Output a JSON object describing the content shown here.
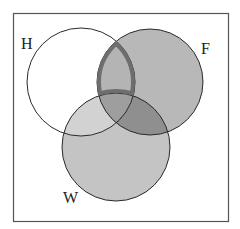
{
  "diagram": {
    "type": "venn-3",
    "sets": [
      {
        "id": "H",
        "label": "H",
        "cx": 81,
        "cy": 82,
        "r": 54,
        "fill": "#ffffff"
      },
      {
        "id": "F",
        "label": "F",
        "cx": 150,
        "cy": 82,
        "r": 53,
        "fill": "#b8b8b8"
      },
      {
        "id": "W",
        "label": "W",
        "cx": 116,
        "cy": 147,
        "r": 54,
        "fill": "#c4c4c4"
      }
    ],
    "regions": {
      "H_and_W_only": "#d2d2d2",
      "F_and_W_only": "#8f8f8f",
      "H_and_F_and_W": "#9e9e9e",
      "H_and_F_not_W": "#b4b4b4"
    },
    "highlight": {
      "region": "H ∩ F ∩ W'",
      "stroke": "#6e6e6e",
      "stroke_width": 4
    },
    "frame": {
      "x": 13,
      "y": 13,
      "width": 216,
      "height": 209,
      "stroke": "#555555"
    },
    "labels": {
      "H": "H",
      "F": "F",
      "W": "W"
    }
  }
}
